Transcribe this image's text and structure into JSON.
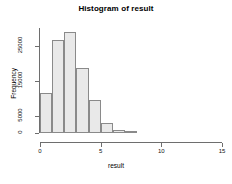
{
  "chart_data": {
    "type": "bar",
    "title": "Histogram of result",
    "xlabel": "result",
    "ylabel": "Frequency",
    "bin_width": 1,
    "bin_starts": [
      0,
      1,
      2,
      3,
      4,
      5,
      6,
      7
    ],
    "categories": [
      "0-1",
      "1-2",
      "2-3",
      "3-4",
      "4-5",
      "5-6",
      "6-7",
      "7-8"
    ],
    "values": [
      11500,
      26500,
      29000,
      18500,
      9500,
      3000,
      900,
      200
    ],
    "xlim": [
      0,
      15
    ],
    "ylim": [
      0,
      30000
    ],
    "xticks": [
      0,
      5,
      10,
      15
    ],
    "xtick_labels": [
      "0",
      "5",
      "10",
      "15"
    ],
    "yticks": [
      0,
      5000,
      15000,
      25000
    ],
    "ytick_labels": [
      "0",
      "5000",
      "15000",
      "25000"
    ],
    "grid": false,
    "legend": false,
    "bar_fill": "#e9e9e9",
    "bar_border": "#8a8a8a",
    "axis_color": "#6e6e6e",
    "background": "#ffffff"
  }
}
